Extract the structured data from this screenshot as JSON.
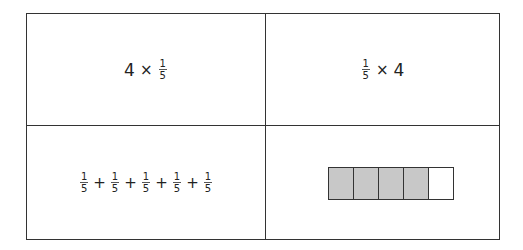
{
  "cells": {
    "top_left": {
      "whole": "4",
      "operator": "×",
      "fraction": {
        "numerator": "1",
        "denominator": "5"
      }
    },
    "top_right": {
      "fraction": {
        "numerator": "1",
        "denominator": "5"
      },
      "operator": "×",
      "whole": "4"
    },
    "bottom_left": {
      "terms": [
        {
          "numerator": "1",
          "denominator": "5"
        },
        {
          "numerator": "1",
          "denominator": "5"
        },
        {
          "numerator": "1",
          "denominator": "5"
        },
        {
          "numerator": "1",
          "denominator": "5"
        },
        {
          "numerator": "1",
          "denominator": "5"
        }
      ],
      "operator": "+"
    },
    "bottom_right": {
      "bar_model": {
        "total_parts": 5,
        "shaded_parts": 4,
        "shaded_color": "#c8c8c8",
        "unshaded_color": "#ffffff"
      }
    }
  }
}
